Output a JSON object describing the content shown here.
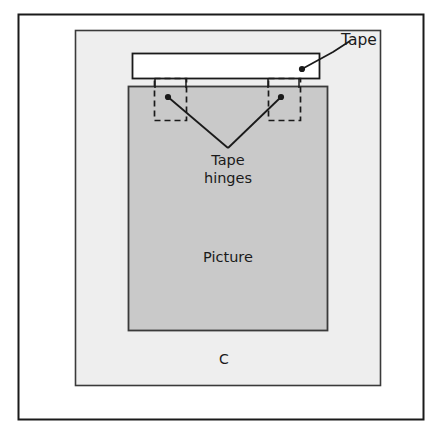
{
  "figure": {
    "id_label": "C",
    "caption_fragment": "",
    "width": 442,
    "height": 436,
    "background_color": "#ffffff",
    "border_color": "#1a1a1a"
  },
  "labels": {
    "tape": "Tape",
    "tape_hinges_line1": "Tape",
    "tape_hinges_line2": "hinges",
    "picture": "Picture",
    "figure_letter": "C"
  },
  "parts": {
    "backing_board": {
      "name": "backing board",
      "fill": "#eeeeee",
      "stroke": "#3a3a3a",
      "x": 75,
      "y": 30,
      "width": 306,
      "height": 356
    },
    "picture": {
      "name": "Picture",
      "fill": "#c9c9c9",
      "stroke": "#3a3a3a",
      "x": 128,
      "y": 86,
      "width": 200,
      "height": 245
    },
    "tape_strip": {
      "name": "Tape",
      "fill": "#ffffff",
      "stroke": "#1a1a1a",
      "x": 132,
      "y": 53,
      "width": 188,
      "height": 25
    },
    "hinge_left": {
      "name": "tape hinge left",
      "stroke": "#1a1a1a",
      "style": "dashed",
      "x": 154,
      "y": 78,
      "width": 32,
      "height": 42
    },
    "hinge_right": {
      "name": "tape hinge right",
      "stroke": "#1a1a1a",
      "style": "dashed",
      "x": 268,
      "y": 78,
      "width": 32,
      "height": 42
    }
  },
  "leaders": {
    "tape": {
      "dot_x": 302,
      "dot_y": 69,
      "elbow_x": 332,
      "elbow_y": 52,
      "end_x": 348,
      "end_y": 40
    },
    "hinge_left": {
      "dot_x": 168,
      "dot_y": 97,
      "vertex_x": 228,
      "vertex_y": 148
    },
    "hinge_right": {
      "dot_x": 281,
      "dot_y": 97,
      "vertex_x": 228,
      "vertex_y": 148
    }
  },
  "bottom_strip": {
    "cut_text": ". .  .   .  .    .  ..  .   .  .  .   .   ..  .  .    .   ."
  }
}
